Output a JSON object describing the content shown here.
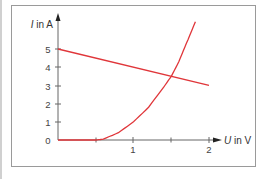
{
  "chart_data": {
    "type": "line",
    "title": "",
    "xlabel": "U in V",
    "ylabel": "I in A",
    "xlim": [
      0,
      2.1
    ],
    "ylim": [
      0,
      6.5
    ],
    "x_ticks": [
      0.5,
      1,
      1.5,
      2
    ],
    "x_tick_labels": [
      "",
      "1",
      "",
      "2"
    ],
    "y_ticks": [
      0,
      1,
      2,
      3,
      4,
      5
    ],
    "y_tick_labels": [
      "0",
      "1",
      "2",
      "3",
      "4",
      "5"
    ],
    "grid": false,
    "legend": null,
    "series": [
      {
        "name": "load line",
        "color": "#e0363a",
        "x": [
          0,
          2
        ],
        "y": [
          5,
          3
        ]
      },
      {
        "name": "diode characteristic",
        "color": "#e0363a",
        "x": [
          0,
          0.5,
          0.6,
          0.8,
          1.0,
          1.2,
          1.4,
          1.5,
          1.6,
          1.7,
          1.82
        ],
        "y": [
          0,
          0,
          0.05,
          0.4,
          1.0,
          1.8,
          2.9,
          3.5,
          4.3,
          5.3,
          6.5
        ]
      }
    ],
    "annotations": [
      {
        "text": "intersection (operating point)",
        "x": 1.5,
        "y": 3.5
      }
    ]
  },
  "labels": {
    "y_axis": "I in A",
    "x_axis": "U in V",
    "y0": "0",
    "y1": "1",
    "y2": "2",
    "y3": "3",
    "y4": "4",
    "y5": "5",
    "x1": "1",
    "x2": "2"
  }
}
